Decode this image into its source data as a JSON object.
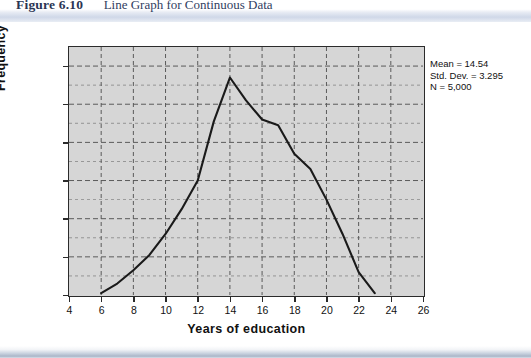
{
  "figure": {
    "label": "Figure 6.10",
    "title": "Line Graph for Continuous Data"
  },
  "colors": {
    "plot_background": "#d6d6d6",
    "plot_border": "#2b2b2b",
    "gridline": "#5a5a5a",
    "data_line": "#1a1a1a",
    "page_background": "#ffffff",
    "header_band": "#cfd8e8",
    "caption_text": "#2a3554"
  },
  "annotation": {
    "mean_line": "Mean = 14.54",
    "std_dev_line": "Std. Dev. = 3.295",
    "n_line": "N = 5,000"
  },
  "chart_data": {
    "type": "line",
    "title": "Line Graph for Continuous Data",
    "xlabel": "Years of education",
    "ylabel": "Frequency",
    "xlim": [
      4,
      26
    ],
    "ylim": [
      0,
      650
    ],
    "grid": true,
    "legend": null,
    "xticks": [
      4,
      6,
      8,
      10,
      12,
      14,
      16,
      18,
      20,
      22,
      24,
      26
    ],
    "xtick_labels": [
      "4",
      "6",
      "8",
      "10",
      "12",
      "14",
      "16",
      "18",
      "20",
      "22",
      "24",
      "26"
    ],
    "yticks": [
      0,
      100,
      200,
      300,
      400,
      500,
      600
    ],
    "ytick_labels": [
      "0.0",
      "100.0",
      "200.0",
      "300.0",
      "400.0",
      "500.0",
      "600.0"
    ],
    "x": [
      6,
      7,
      8,
      9,
      10,
      11,
      12,
      13,
      14,
      15,
      16,
      17,
      18,
      19,
      20,
      21,
      22,
      23
    ],
    "values": [
      5,
      30,
      65,
      105,
      160,
      225,
      300,
      455,
      570,
      510,
      460,
      445,
      370,
      330,
      250,
      160,
      60,
      5
    ],
    "series": [
      {
        "name": "Frequency",
        "values": [
          5,
          30,
          65,
          105,
          160,
          225,
          300,
          455,
          570,
          510,
          460,
          445,
          370,
          330,
          250,
          160,
          60,
          5
        ]
      }
    ],
    "summary_statistics": {
      "mean": 14.54,
      "std_dev": 3.295,
      "n": 5000
    }
  }
}
